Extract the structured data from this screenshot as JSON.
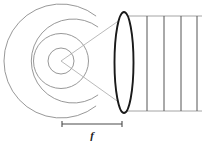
{
  "figure": {
    "type": "optics-ray-diagram",
    "canvas": {
      "width": 202,
      "height": 144,
      "background": "#ffffff"
    }
  },
  "labels": {
    "focal_length": "f"
  },
  "colors": {
    "wavefront_arc": "#8c8c8c",
    "ray_line": "#a8a8a8",
    "lens_outline": "#1a1a1a",
    "plane_wave": "#545454",
    "beam_edge": "#9a9a9a",
    "scale_rule": "#4a4a4a",
    "label_text": "#1a1a1a",
    "background": "#ffffff"
  },
  "source": {
    "name": "point-source",
    "cx": 61,
    "cy": 61
  },
  "wavefronts": {
    "description": "Four concentric spherical wavefront arcs expanding from the point source",
    "count": 4,
    "radii": [
      13,
      27.5,
      42,
      57
    ],
    "arc_spans_deg": [
      {
        "start": -180,
        "end": 180
      },
      {
        "start": -180,
        "end": 180
      },
      {
        "start": -152,
        "end": 152
      },
      {
        "start": -128,
        "end": 128
      }
    ]
  },
  "rays": {
    "description": "Two straight rays from the source to the upper and lower lens margins",
    "count": 2,
    "segments": [
      {
        "x1": 61,
        "y1": 61,
        "x2": 127,
        "y2": 15
      },
      {
        "x1": 61,
        "y1": 61,
        "x2": 127,
        "y2": 108
      }
    ]
  },
  "lens": {
    "name": "converging-lens",
    "cx": 124,
    "cy": 62.5,
    "rx": 9.5,
    "ry": 50.5
  },
  "plane_waves": {
    "description": "Plane wavefronts emerging on the image side of the lens",
    "count": 4,
    "x_positions": [
      147,
      164,
      181,
      197
    ],
    "y_top": 16,
    "y_bottom": 111
  },
  "beam_edges": {
    "description": "Horizontal boundary lines of the collimated output beam",
    "top_y": 16,
    "bottom_y": 111,
    "x_start": 124,
    "x_end": 202
  },
  "scale_bar": {
    "name": "focal-length-rule",
    "y": 124,
    "x_start": 62,
    "x_end": 122,
    "tick_height": 5,
    "label_x": 92,
    "label_y": 139
  }
}
